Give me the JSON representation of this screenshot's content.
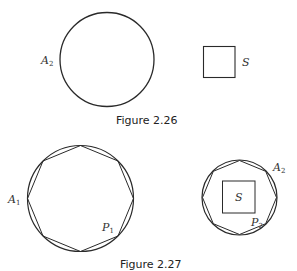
{
  "figure_226": {
    "caption": "Figure 2.26",
    "circle_label": "A",
    "circle_label_sub": "2",
    "square_label": "S"
  },
  "figure_227": {
    "caption": "Figure 2.27",
    "left_circle_label": "A",
    "left_circle_label_sub": "1",
    "left_polygon_label": "P",
    "left_polygon_label_sub": "1",
    "right_circle_label": "A",
    "right_circle_label_sub": "2",
    "right_polygon_label": "P",
    "right_polygon_label_sub": "2",
    "inner_square_label": "S"
  },
  "colors": {
    "stroke": "#2a2a2a",
    "background": "#ffffff"
  }
}
